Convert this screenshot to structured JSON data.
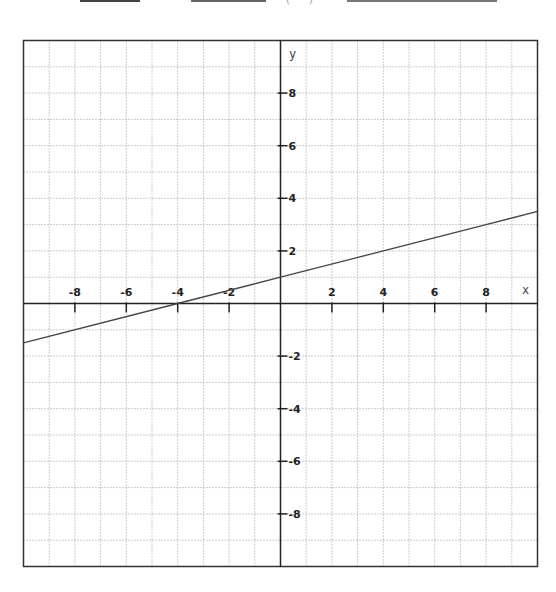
{
  "header_fragments": {
    "blanks": [
      {
        "x1": 80,
        "x2": 140
      },
      {
        "x1": 191,
        "x2": 266
      },
      {
        "x1": 347,
        "x2": 497
      }
    ],
    "paren_text": "( )"
  },
  "chart_data": {
    "type": "line",
    "title": "",
    "xlabel": "x",
    "ylabel": "y",
    "xlim": [
      -10,
      10
    ],
    "ylim": [
      -10,
      10
    ],
    "grid": true,
    "grid_step": 1,
    "x_ticks": [
      -8,
      -6,
      -4,
      -2,
      2,
      4,
      6,
      8
    ],
    "y_ticks": [
      8,
      6,
      4,
      2,
      -2,
      -4,
      -6,
      -8
    ],
    "x_tick_labels": [
      "-8",
      "-6",
      "-4",
      "-2",
      "2",
      "4",
      "6",
      "8"
    ],
    "y_tick_labels": [
      "8",
      "6",
      "4",
      "2",
      "-2",
      "-4",
      "-6",
      "-8"
    ],
    "series": [
      {
        "name": "y = 0.25x + 1",
        "equation": "y = 0.25x + 1",
        "slope": 0.25,
        "intercept": 1,
        "x": [
          -10,
          -4,
          0,
          4,
          8,
          10
        ],
        "values": [
          -1.5,
          0,
          1,
          2,
          3,
          3.5
        ]
      }
    ],
    "legend": null
  },
  "colors": {
    "axis": "#222222",
    "grid": "#9a9a9a",
    "line": "#444444",
    "frame": "#333333"
  }
}
